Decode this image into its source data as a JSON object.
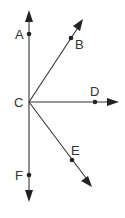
{
  "diagram": {
    "type": "rays-from-common-vertex",
    "vertex": {
      "label": "C",
      "x": 29,
      "y": 102
    },
    "points": [
      {
        "label": "A",
        "x": 29,
        "y": 34
      },
      {
        "label": "B",
        "x": 71,
        "y": 38
      },
      {
        "label": "D",
        "x": 95,
        "y": 102
      },
      {
        "label": "E",
        "x": 72,
        "y": 160
      },
      {
        "label": "F",
        "x": 29,
        "y": 175
      }
    ],
    "rays": [
      {
        "name": "ray-CA",
        "through": "A",
        "direction": "up"
      },
      {
        "name": "ray-CB",
        "through": "B",
        "direction": "up-right"
      },
      {
        "name": "ray-CD",
        "through": "D",
        "direction": "right"
      },
      {
        "name": "ray-CE",
        "through": "E",
        "direction": "down-right"
      },
      {
        "name": "ray-CF",
        "through": "F",
        "direction": "down"
      }
    ],
    "colors": {
      "line": "#333333",
      "point": "#222222",
      "background": "#ffffff"
    }
  }
}
